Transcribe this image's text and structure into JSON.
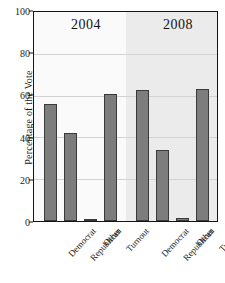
{
  "chart_data": {
    "type": "bar",
    "title": "",
    "subtitle": "",
    "xlabel": "",
    "ylabel": "Percentage of the Vote",
    "ylim": [
      0,
      100
    ],
    "yticks": [
      0,
      20,
      40,
      60,
      80,
      100
    ],
    "ytick_labels": [
      "0",
      "20",
      "40",
      "60",
      "80",
      "100"
    ],
    "grid": true,
    "legend": false,
    "legend_position": "none",
    "categories": [
      "Democrat",
      "Republican",
      "Other",
      "Turnout"
    ],
    "groups": [
      {
        "label": "2004",
        "categories": [
          "Democrat",
          "Republican",
          "Other",
          "Turnout"
        ],
        "values": [
          55.5,
          41.7,
          1.0,
          60.0
        ]
      },
      {
        "label": "2008",
        "categories": [
          "Democrat",
          "Republican",
          "Other",
          "Turnout"
        ],
        "values": [
          62.0,
          33.8,
          1.5,
          62.8
        ]
      }
    ],
    "bar_color": "#7d7d7d",
    "bar_edge_color": "#3a3a3a",
    "panel_left_color": "#fafafa",
    "panel_right_color": "#ebebeb",
    "gridline_color": "#d2d2d2",
    "axis_color": "#141414",
    "annotations": [
      {
        "text": "2004",
        "group": 0
      },
      {
        "text": "2008",
        "group": 1
      }
    ]
  }
}
